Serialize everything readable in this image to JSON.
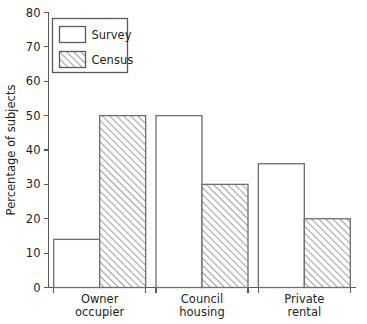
{
  "chart_data": {
    "type": "bar",
    "title": "",
    "subtitle": "",
    "xlabel": "",
    "ylabel": "Percentage of subjects",
    "categories": [
      "Owner occupier",
      "Council housing",
      "Private rental"
    ],
    "category_lines": [
      [
        "Owner",
        "occupier"
      ],
      [
        "Council",
        "housing"
      ],
      [
        "Private",
        "rental"
      ]
    ],
    "series": [
      {
        "name": "Survey",
        "values": [
          14,
          50,
          36
        ],
        "fill": "none"
      },
      {
        "name": "Census",
        "values": [
          50,
          30,
          20
        ],
        "fill": "diagonal-hatch"
      }
    ],
    "ylim": [
      0,
      80
    ],
    "ytick_values": [
      0,
      10,
      20,
      30,
      40,
      50,
      60,
      70,
      80
    ],
    "ytick_labels": [
      "0",
      "10",
      "20",
      "30",
      "40",
      "50",
      "60",
      "70",
      "80"
    ],
    "grid": false,
    "legend_position": "top-left",
    "legend_entries": [
      "Survey",
      "Census"
    ],
    "colors": {
      "axis": "#58595b",
      "bar_outline": "#6d6e71",
      "hatch": "#808285",
      "text": "#231f20",
      "background": "#ffffff"
    }
  }
}
